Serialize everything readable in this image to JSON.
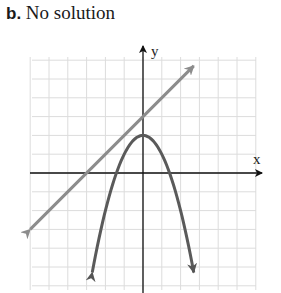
{
  "header": {
    "part_label": "b.",
    "caption": "No solution"
  },
  "chart_data": {
    "type": "line",
    "title": "b. No solution",
    "xlabel": "x",
    "ylabel": "y",
    "xlim": [
      -6,
      6
    ],
    "ylim": [
      -6,
      6
    ],
    "grid": true,
    "tick_labels_shown": false,
    "series": [
      {
        "name": "line",
        "equation": "y = x + 3",
        "color": "#8c8c8c",
        "x": [
          -6,
          -3,
          0,
          2.7
        ],
        "y": [
          -3,
          0,
          3,
          5.7
        ]
      },
      {
        "name": "parabola",
        "equation": "y = -x^2 + 2",
        "color": "#5a5a5a",
        "x": [
          -2.7,
          -2,
          -1.41,
          -1,
          0,
          1,
          1.41,
          2,
          2.7
        ],
        "y": [
          -5.29,
          -2,
          0,
          1,
          2,
          1,
          0,
          -2,
          -5.29
        ]
      }
    ],
    "annotations": [
      "No solution"
    ],
    "intersections": []
  }
}
